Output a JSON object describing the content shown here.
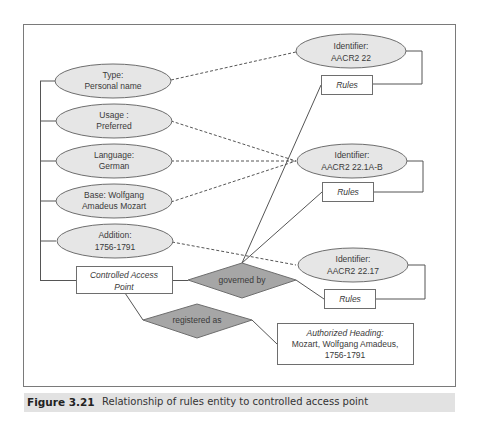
{
  "figure": {
    "number": "Figure 3.21",
    "caption": "Relationship of rules entity to controlled access point"
  },
  "colors": {
    "frame": "#7a7a7a",
    "ellipse_fill": "#e6e6e6",
    "ellipse_stroke": "#6e6e6e",
    "diamond_fill": "#a6a6a6",
    "line": "#555555",
    "caption_bg": "#e2e2e2"
  },
  "attributes": [
    {
      "line1": "Type:",
      "line2": "Personal name"
    },
    {
      "line1": "Usage :",
      "line2": "Preferred"
    },
    {
      "line1": "Language:",
      "line2": "German"
    },
    {
      "line1": "Base:  Wolfgang",
      "line2": "Amadeus Mozart"
    },
    {
      "line1": "Addition:",
      "line2": "1756-1791"
    }
  ],
  "controlled_access_point": {
    "line1": "Controlled Access",
    "line2": "Point"
  },
  "relationships": {
    "governed_by": "governed by",
    "registered_as": "registered as"
  },
  "identifiers": [
    {
      "line1": "Identifier:",
      "line2": "AACR2 22",
      "rules": "Rules"
    },
    {
      "line1": "Identifier:",
      "line2": "AACR2 22.1A-B",
      "rules": "Rules"
    },
    {
      "line1": "Identifier:",
      "line2": "AACR2 22.17",
      "rules": "Rules"
    }
  ],
  "authorized_heading": {
    "line1": "Authorized Heading:",
    "line2": "Mozart, Wolfgang Amadeus,",
    "line3": "1756-1791"
  }
}
